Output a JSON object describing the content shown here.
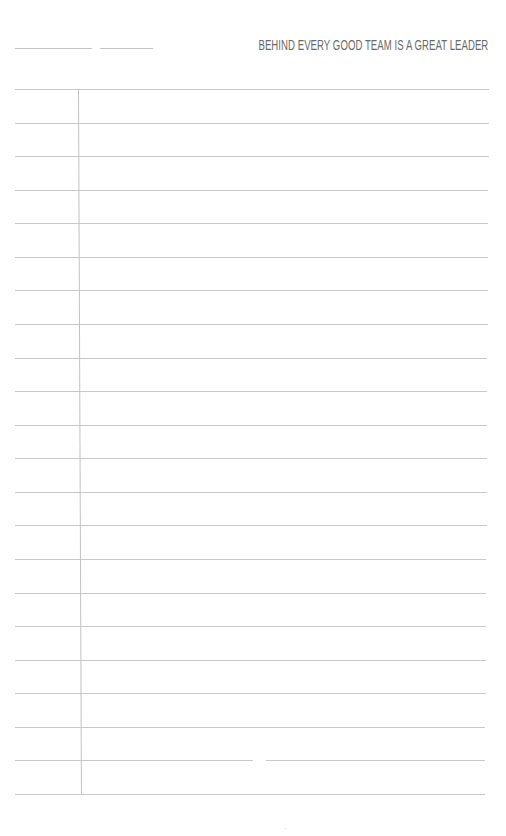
{
  "page": {
    "type": "lined notebook page",
    "header": {
      "quote": "BEHIND EVERY GOOD TEAM IS A GREAT LEADER",
      "blank_fields": [
        {
          "name": "date-field",
          "x1": 15,
          "x2": 92,
          "y": 48
        },
        {
          "name": "title-field",
          "x1": 100,
          "x2": 153,
          "y": 48
        }
      ]
    },
    "ruling": {
      "line_count": 22,
      "first_line_y": 89,
      "last_line_y": 794,
      "line_color": "#c9c9c9",
      "margin_line_x_top": 79,
      "margin_line_x_bottom": 76,
      "margin_color": "#c2c2c2",
      "line_left_x": 15,
      "line_right_x_top": 489,
      "line_right_x_bottom": 485
    },
    "colors": {
      "background": "#ffffff",
      "text": "#6a6a6a"
    }
  }
}
